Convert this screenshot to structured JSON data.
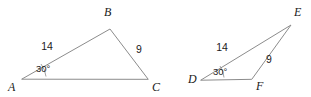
{
  "figure": {
    "stroke_color": "#8c8c8c",
    "text_color": "#1a1a1a",
    "background": "#ffffff",
    "triangles": [
      {
        "id": "left",
        "name": "triangle-abc",
        "vertices": [
          {
            "label": "A",
            "x": 22,
            "y": 79,
            "label_x": 8,
            "label_y": 91
          },
          {
            "label": "B",
            "x": 110,
            "y": 29,
            "label_x": 104,
            "label_y": 16
          },
          {
            "label": "C",
            "x": 148,
            "y": 79,
            "label_x": 152,
            "label_y": 91
          }
        ],
        "path": "M 22 79 L 110 29 L 148 79 Z",
        "sides": [
          {
            "name": "AB",
            "value": "14",
            "x": 47,
            "y": 50
          },
          {
            "name": "BC",
            "value": "9",
            "x": 139,
            "y": 53
          }
        ],
        "angles": [
          {
            "at": "A",
            "value": "30°",
            "x": 36,
            "y": 72,
            "arc": "M 46 76.5 A 25 25 0 0 0 41 64"
          }
        ]
      },
      {
        "id": "right",
        "name": "triangle-def",
        "vertices": [
          {
            "label": "D",
            "x": 201,
            "y": 80,
            "label_x": 188,
            "label_y": 83
          },
          {
            "label": "E",
            "x": 291,
            "y": 25,
            "label_x": 294,
            "label_y": 16
          },
          {
            "label": "F",
            "x": 252,
            "y": 79,
            "label_x": 256,
            "label_y": 90
          }
        ],
        "path": "M 201 80 L 291 25 L 252 79 Z",
        "sides": [
          {
            "name": "DE",
            "value": "14",
            "x": 222,
            "y": 51
          },
          {
            "name": "EF",
            "value": "9",
            "x": 269,
            "y": 63
          }
        ],
        "angles": [
          {
            "at": "D",
            "value": "30°",
            "x": 213,
            "y": 75,
            "arc": "M 224 77.5 A 24 24 0 0 0 220 66"
          }
        ]
      }
    ]
  }
}
